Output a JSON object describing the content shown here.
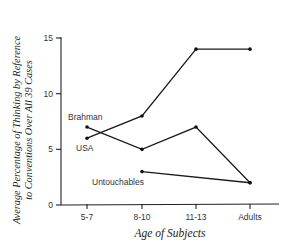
{
  "chart_data": {
    "type": "line",
    "title": "",
    "xlabel": "Age of Subjects",
    "ylabel_lines": [
      "Average Percentage of Thinking by Reference",
      "to Conventions Over All 39 Cases"
    ],
    "ylabel": "Average Percentage of Thinking by Reference to Conventions Over All 39 Cases",
    "categories": [
      "5-7",
      "8-10",
      "11-13",
      "Adults"
    ],
    "yticks": [
      0,
      5,
      10,
      15
    ],
    "ylim": [
      0,
      15
    ],
    "grid": false,
    "legend": "inline labels",
    "series": [
      {
        "name": "USA",
        "values": [
          6,
          8,
          14,
          14
        ]
      },
      {
        "name": "Brahman",
        "values": [
          7,
          5,
          7,
          2
        ]
      },
      {
        "name": "Untouchables",
        "values": [
          null,
          3,
          null,
          2
        ]
      }
    ]
  }
}
